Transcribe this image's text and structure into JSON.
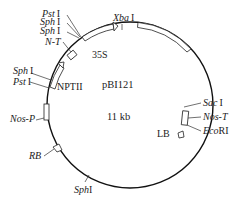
{
  "plasmid": {
    "name": "pBI121",
    "size": "11 kb"
  },
  "features": [
    {
      "name": "35S",
      "type": "promoter-arrow"
    },
    {
      "name": "NPTII",
      "type": "gene-arrow"
    },
    {
      "name": "Nos-P",
      "type": "promoter"
    },
    {
      "name": "N-T",
      "type": "terminator"
    },
    {
      "name": "Nos-T",
      "type": "terminator"
    },
    {
      "name": "RB",
      "type": "border"
    },
    {
      "name": "LB",
      "type": "border"
    }
  ],
  "restriction_sites": {
    "pst1_top": {
      "enzyme": "Pst",
      "numeral": "I"
    },
    "sph1_top_a": {
      "enzyme": "Sph",
      "numeral": "I"
    },
    "sph1_top_b": {
      "enzyme": "Sph",
      "numeral": "I"
    },
    "xba1": {
      "enzyme": "Xba",
      "numeral": "I"
    },
    "sph1_left": {
      "enzyme": "Sph",
      "numeral": "I"
    },
    "pst1_left": {
      "enzyme": "Pst",
      "numeral": "I"
    },
    "sac1": {
      "enzyme": "Sac",
      "numeral": "I"
    },
    "ecori": {
      "enzyme": "Eco",
      "numeral": "RI"
    },
    "sph1_bottom": {
      "enzyme": "Sph",
      "numeral": "I"
    }
  },
  "labels": {
    "n_t": "N-T",
    "s35": "35S",
    "nptii": "NPTII",
    "nos_p": "Nos-P",
    "nos_t": "Nos-T",
    "rb": "RB",
    "lb": "LB"
  }
}
